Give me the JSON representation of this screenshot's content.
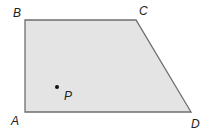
{
  "diagram": {
    "shape": "trapezoid",
    "fill": "#e4e4e4",
    "stroke": "#6e6e6e",
    "vertices": [
      {
        "label": "A",
        "x": 25,
        "y": 112
      },
      {
        "label": "B",
        "x": 25,
        "y": 20
      },
      {
        "label": "C",
        "x": 136,
        "y": 20
      },
      {
        "label": "D",
        "x": 191,
        "y": 112
      }
    ],
    "point": {
      "label": "P",
      "x": 57,
      "y": 87
    }
  }
}
